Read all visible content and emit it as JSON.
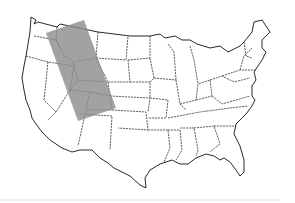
{
  "map": {
    "subject": "United States (contiguous) state outline map",
    "highlight": {
      "shape": "rotated-rectangle",
      "color": "#9a9a9a",
      "opacity": 0.85,
      "corners": [
        [
          46,
          33
        ],
        [
          84,
          20
        ],
        [
          116,
          108
        ],
        [
          78,
          121
        ]
      ],
      "covers_regions": [
        "Idaho",
        "Montana (west)",
        "Wyoming",
        "Utah",
        "Colorado (west)",
        "Arizona (northeast)"
      ]
    },
    "outline_color": "#222222",
    "background": "#ffffff"
  }
}
